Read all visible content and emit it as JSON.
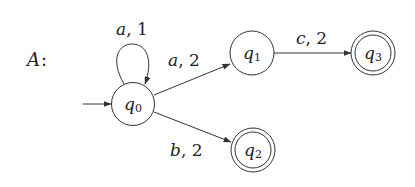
{
  "automaton": {
    "name": "A",
    "name_suffix": ":",
    "states": [
      {
        "id": "q0",
        "base": "q",
        "sub": "0",
        "initial": true,
        "accepting": false
      },
      {
        "id": "q1",
        "base": "q",
        "sub": "1",
        "initial": false,
        "accepting": false
      },
      {
        "id": "q2",
        "base": "q",
        "sub": "2",
        "initial": false,
        "accepting": true
      },
      {
        "id": "q3",
        "base": "q",
        "sub": "3",
        "initial": false,
        "accepting": true
      }
    ],
    "transitions": [
      {
        "from": "q0",
        "to": "q0",
        "symbol": "a",
        "weight": "1"
      },
      {
        "from": "q0",
        "to": "q1",
        "symbol": "a",
        "weight": "2"
      },
      {
        "from": "q0",
        "to": "q2",
        "symbol": "b",
        "weight": "2"
      },
      {
        "from": "q1",
        "to": "q3",
        "symbol": "c",
        "weight": "2"
      }
    ]
  },
  "colors": {
    "stroke": "#333333",
    "text": "#222222",
    "background": "#ffffff"
  }
}
